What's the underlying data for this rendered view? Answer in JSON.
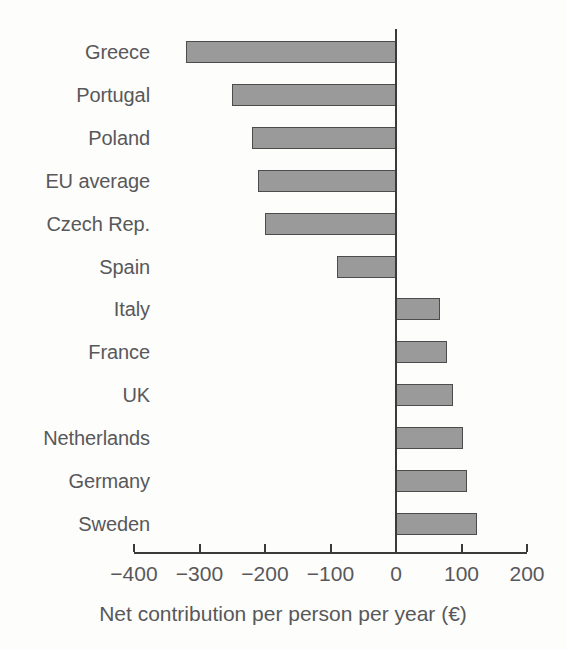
{
  "chart_data": {
    "type": "bar",
    "orientation": "horizontal",
    "title": "",
    "xlabel": "Net contribution per person per year (€)",
    "ylabel": "",
    "categories": [
      "Greece",
      "Portugal",
      "Poland",
      "EU average",
      "Czech Rep.",
      "Spain",
      "Italy",
      "France",
      "UK",
      "Netherlands",
      "Germany",
      "Sweden"
    ],
    "values": [
      -320,
      -250,
      -220,
      -210,
      -200,
      -90,
      67,
      78,
      87,
      102,
      108,
      124
    ],
    "xlim": [
      -400,
      200
    ],
    "xticks": [
      -400,
      -300,
      -200,
      -100,
      0,
      100,
      200
    ],
    "xtick_labels": [
      "−400",
      "−300",
      "−200",
      "−100",
      "0",
      "100",
      "200"
    ],
    "grid": false,
    "legend": null,
    "bar_color": "#9a9a9a",
    "bar_border_color": "#4c4c4c",
    "axis_color": "#3a3a3a",
    "text_color": "#58585a",
    "background_color": "#fdfdfb"
  },
  "axis": {
    "x_title": "Net contribution per person per year (€)"
  },
  "labels": {
    "greece": "Greece",
    "portugal": "Portugal",
    "poland": "Poland",
    "eu_average": "EU average",
    "czech_rep": "Czech Rep.",
    "spain": "Spain",
    "italy": "Italy",
    "france": "France",
    "uk": "UK",
    "netherlands": "Netherlands",
    "germany": "Germany",
    "sweden": "Sweden"
  }
}
